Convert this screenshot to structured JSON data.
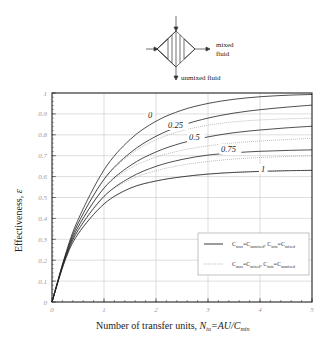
{
  "diagram": {
    "mixed_label_line1": "mixed",
    "mixed_label_line2": "fluid",
    "unmixed_label": "unmixed fluid"
  },
  "chart_data": {
    "type": "line",
    "title": "",
    "xlabel": "Number of transfer units, N_tu = AU/C_min",
    "ylabel": "Effectiveness, ε",
    "xlim": [
      0,
      5
    ],
    "ylim": [
      0,
      1
    ],
    "xticks": [
      "0",
      "1",
      "2",
      "3",
      "4",
      "5"
    ],
    "yticks": [
      "0",
      "0.1",
      "0.2",
      "0.3",
      "0.4",
      "0.5",
      "0.6",
      "0.7",
      "0.8",
      "0.9",
      "1"
    ],
    "grid": true,
    "legend_position": "lower right",
    "legend": [
      {
        "style": "solid",
        "label": "C_max=C_unmixed, C_min=C_mixed"
      },
      {
        "style": "dotted",
        "label": "C_max=C_mixed, C_min=C_unmixed"
      }
    ],
    "x": [
      0,
      0.25,
      0.5,
      1,
      1.5,
      2,
      2.5,
      3,
      3.5,
      4,
      4.5,
      5
    ],
    "series": [
      {
        "name": "Cr=0 (both)",
        "style": "solid",
        "label": "0",
        "values": [
          0,
          0.221,
          0.393,
          0.632,
          0.777,
          0.865,
          0.918,
          0.95,
          0.97,
          0.982,
          0.989,
          0.993
        ]
      },
      {
        "name": "Cr=0.25 solid",
        "style": "solid",
        "label": "0.25",
        "values": [
          0,
          0.215,
          0.375,
          0.587,
          0.713,
          0.793,
          0.845,
          0.88,
          0.904,
          0.92,
          0.932,
          0.942
        ]
      },
      {
        "name": "Cr=0.5 solid",
        "style": "solid",
        "label": "0.5",
        "values": [
          0,
          0.209,
          0.358,
          0.545,
          0.652,
          0.718,
          0.761,
          0.79,
          0.81,
          0.823,
          0.833,
          0.841
        ]
      },
      {
        "name": "Cr=0.75 solid",
        "style": "solid",
        "label": "0.75",
        "values": [
          0,
          0.204,
          0.342,
          0.505,
          0.595,
          0.649,
          0.682,
          0.703,
          0.714,
          0.721,
          0.725,
          0.728
        ]
      },
      {
        "name": "Cr=1 solid",
        "style": "solid",
        "label": "1",
        "values": [
          0,
          0.198,
          0.325,
          0.469,
          0.544,
          0.579,
          0.599,
          0.612,
          0.62,
          0.625,
          0.628,
          0.63
        ]
      },
      {
        "name": "Cr=0.25 dotted",
        "style": "dotted",
        "values": [
          0,
          0.215,
          0.376,
          0.585,
          0.704,
          0.776,
          0.819,
          0.846,
          0.862,
          0.871,
          0.876,
          0.88
        ]
      },
      {
        "name": "Cr=0.5 dotted",
        "style": "dotted",
        "values": [
          0,
          0.21,
          0.36,
          0.544,
          0.639,
          0.693,
          0.726,
          0.747,
          0.761,
          0.77,
          0.777,
          0.783
        ]
      },
      {
        "name": "Cr=0.75 dotted",
        "style": "dotted",
        "values": [
          0,
          0.206,
          0.345,
          0.507,
          0.585,
          0.628,
          0.655,
          0.672,
          0.684,
          0.691,
          0.696,
          0.7
        ]
      },
      {
        "name": "Cr=1 dotted",
        "style": "dotted",
        "values": [
          0,
          0.198,
          0.325,
          0.469,
          0.544,
          0.579,
          0.599,
          0.612,
          0.62,
          0.625,
          0.628,
          0.63
        ]
      }
    ],
    "curve_labels": [
      {
        "text": "0",
        "x": 148,
        "y": 118
      },
      {
        "text": "0.25",
        "x": 168,
        "y": 128
      },
      {
        "text": "0.5",
        "x": 189,
        "y": 140
      },
      {
        "text": "0.75",
        "x": 221,
        "y": 152
      },
      {
        "text": "1",
        "x": 261,
        "y": 172
      }
    ],
    "xlabel_parts": {
      "main": "Number of transfer units, ",
      "N": "N",
      "tu": "tu",
      "eq": "=AU/C",
      "min": "min"
    },
    "ylabel_text": "Effectiveness, ",
    "ylabel_symbol": "ε",
    "legend_parts": [
      {
        "c1": "C",
        "s1": "max",
        "eq1": "=C",
        "s2": "unmixed",
        "comma": ", C",
        "s3": "min",
        "eq2": "=C",
        "s4": "mixed"
      },
      {
        "c1": "C",
        "s1": "max",
        "eq1": "=C",
        "s2": "mixed",
        "comma": ", C",
        "s3": "min",
        "eq2": "=C",
        "s4": "unmixed"
      }
    ]
  }
}
